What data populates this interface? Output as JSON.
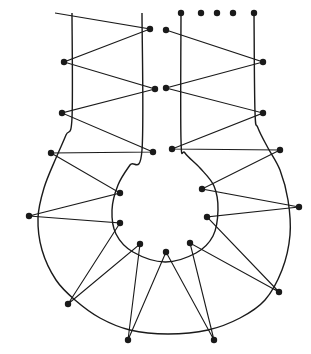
{
  "diagram": {
    "stroke_color": "#1a1a1a",
    "background": "#ffffff",
    "outer_outline": [
      [
        72,
        13
      ],
      [
        72,
        118
      ],
      [
        66,
        135
      ],
      [
        56,
        158
      ],
      [
        44,
        188
      ],
      [
        38,
        218
      ],
      [
        42,
        250
      ],
      [
        56,
        280
      ],
      [
        75,
        300
      ],
      [
        100,
        318
      ],
      [
        130,
        330
      ],
      [
        168,
        334
      ],
      [
        208,
        330
      ],
      [
        240,
        318
      ],
      [
        265,
        300
      ],
      [
        282,
        270
      ],
      [
        290,
        235
      ],
      [
        288,
        200
      ],
      [
        280,
        170
      ],
      [
        268,
        148
      ],
      [
        258,
        128
      ],
      [
        255,
        112
      ],
      [
        254,
        13
      ]
    ],
    "inner_outline": [
      [
        142,
        13
      ],
      [
        142,
        150
      ],
      [
        130,
        165
      ],
      [
        118,
        185
      ],
      [
        112,
        210
      ],
      [
        116,
        234
      ],
      [
        133,
        252
      ],
      [
        165,
        262
      ],
      [
        196,
        253
      ],
      [
        213,
        236
      ],
      [
        218,
        210
      ],
      [
        214,
        186
      ],
      [
        200,
        168
      ],
      [
        185,
        153
      ],
      [
        181,
        140
      ],
      [
        181,
        13
      ]
    ],
    "thread_path": [
      [
        55,
        13
      ],
      [
        150,
        29
      ],
      [
        64,
        62
      ],
      [
        155,
        89
      ],
      [
        62,
        113
      ],
      [
        153,
        152
      ],
      [
        51,
        153
      ],
      [
        120,
        193
      ],
      [
        29,
        216
      ],
      [
        120,
        223
      ],
      [
        68,
        304
      ],
      [
        140,
        244
      ],
      [
        128,
        340
      ],
      [
        166,
        252
      ],
      [
        214,
        340
      ],
      [
        190,
        243
      ],
      [
        279,
        292
      ],
      [
        207,
        217
      ],
      [
        299,
        207
      ],
      [
        202,
        189
      ],
      [
        280,
        150
      ],
      [
        172,
        149
      ],
      [
        263,
        113
      ],
      [
        166,
        88
      ],
      [
        263,
        62
      ],
      [
        166,
        30
      ]
    ],
    "dots": [
      [
        150,
        29
      ],
      [
        64,
        62
      ],
      [
        155,
        89
      ],
      [
        62,
        113
      ],
      [
        153,
        152
      ],
      [
        51,
        153
      ],
      [
        120,
        193
      ],
      [
        29,
        216
      ],
      [
        120,
        223
      ],
      [
        68,
        304
      ],
      [
        140,
        244
      ],
      [
        128,
        340
      ],
      [
        166,
        252
      ],
      [
        214,
        340
      ],
      [
        190,
        243
      ],
      [
        279,
        292
      ],
      [
        207,
        217
      ],
      [
        299,
        207
      ],
      [
        202,
        189
      ],
      [
        280,
        150
      ],
      [
        172,
        149
      ],
      [
        263,
        113
      ],
      [
        166,
        88
      ],
      [
        263,
        62
      ],
      [
        166,
        30
      ],
      [
        181,
        13
      ],
      [
        201,
        13
      ],
      [
        217,
        13
      ],
      [
        233,
        13
      ],
      [
        254,
        13
      ]
    ]
  }
}
